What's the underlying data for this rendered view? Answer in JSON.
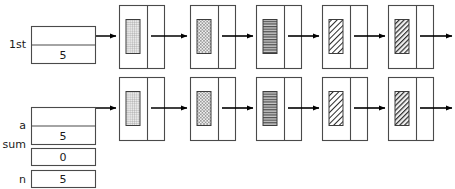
{
  "diagram": {
    "background": "#ffffff",
    "stroke": "#4a4a4a",
    "arrow_color": "#000000"
  },
  "variables": [
    {
      "name": "first-pointer-variable",
      "label": "1st",
      "type": "pointer-box",
      "value": "5",
      "x": 31,
      "y": 26,
      "w": 64,
      "h": 37,
      "label_x": 26,
      "label_y": 48
    },
    {
      "name": "a-pointer-variable",
      "label": "a",
      "type": "pointer-box",
      "value": "5",
      "x": 31,
      "y": 107,
      "w": 64,
      "h": 37,
      "label_x": 26,
      "label_y": 129
    },
    {
      "name": "sum-variable",
      "label": "sum",
      "type": "value-box",
      "value": "0",
      "x": 31,
      "y": 148,
      "w": 64,
      "h": 17,
      "label_x": 26,
      "label_y": 148
    },
    {
      "name": "n-variable",
      "label": "n",
      "type": "value-box",
      "value": "5",
      "x": 31,
      "y": 170,
      "w": 64,
      "h": 17,
      "label_x": 26,
      "label_y": 183
    }
  ],
  "rows": [
    {
      "name": "row-first-list",
      "y": 5,
      "node_h": 63,
      "mid_y": 36,
      "head_arrow": {
        "x1": 60,
        "x2": 116,
        "y": 36
      },
      "nodes": [
        {
          "name": "node-1",
          "x": 119,
          "w": 45,
          "split": 28,
          "fill": "grid",
          "fill_label": "fine-grid",
          "out_arrow": {
            "x1": 166,
            "x2": 187
          }
        },
        {
          "name": "node-2",
          "x": 190,
          "w": 45,
          "split": 28,
          "fill": "checker",
          "fill_label": "checkerboard",
          "out_arrow": {
            "x1": 237,
            "x2": 253
          }
        },
        {
          "name": "node-3",
          "x": 256,
          "w": 45,
          "split": 28,
          "fill": "hstripe",
          "fill_label": "horizontal-lines",
          "out_arrow": {
            "x1": 303,
            "x2": 319
          }
        },
        {
          "name": "node-4",
          "x": 322,
          "w": 45,
          "split": 28,
          "fill": "diag-thin",
          "fill_label": "diagonal-thin",
          "out_arrow": {
            "x1": 369,
            "x2": 385
          }
        },
        {
          "name": "node-5",
          "x": 388,
          "w": 45,
          "split": 28,
          "fill": "diag-thick",
          "fill_label": "diagonal-thick",
          "out_arrow": {
            "x1": 435,
            "x2": 452
          }
        }
      ]
    },
    {
      "name": "row-a-list",
      "y": 77,
      "node_h": 63,
      "mid_y": 108,
      "head_arrow": {
        "x1": 60,
        "x2": 116,
        "y": 108
      },
      "nodes": [
        {
          "name": "node-1",
          "x": 119,
          "w": 45,
          "split": 28,
          "fill": "grid",
          "fill_label": "fine-grid",
          "out_arrow": {
            "x1": 166,
            "x2": 187
          }
        },
        {
          "name": "node-2",
          "x": 190,
          "w": 45,
          "split": 28,
          "fill": "checker",
          "fill_label": "checkerboard",
          "out_arrow": {
            "x1": 237,
            "x2": 253
          }
        },
        {
          "name": "node-3",
          "x": 256,
          "w": 45,
          "split": 28,
          "fill": "hstripe",
          "fill_label": "horizontal-lines",
          "out_arrow": {
            "x1": 303,
            "x2": 319
          }
        },
        {
          "name": "node-4",
          "x": 322,
          "w": 45,
          "split": 28,
          "fill": "diag-thin",
          "fill_label": "diagonal-thin",
          "out_arrow": {
            "x1": 369,
            "x2": 385
          }
        },
        {
          "name": "node-5",
          "x": 388,
          "w": 45,
          "split": 28,
          "fill": "diag-thick",
          "fill_label": "diagonal-thick",
          "out_arrow": {
            "x1": 435,
            "x2": 452
          }
        }
      ]
    }
  ]
}
